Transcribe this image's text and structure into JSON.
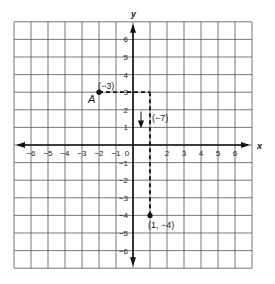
{
  "figure": {
    "type": "coordinate-grid",
    "grid": {
      "x_min": -7,
      "x_max": 7,
      "y_min": -7,
      "y_max": 7,
      "step": 1
    },
    "axes": {
      "x_label": "x",
      "y_label": "y",
      "x_ticks": [
        "-6",
        "-5",
        "-4",
        "-3",
        "-2",
        "-1",
        "0",
        "2",
        "3",
        "4",
        "5",
        "6"
      ],
      "y_ticks": [
        "6",
        "5",
        "4",
        "3",
        "2",
        "1",
        "-1",
        "-2",
        "-3",
        "-4",
        "-5",
        "-6"
      ]
    },
    "points": [
      {
        "name": "A",
        "x": -2,
        "y": 3,
        "label": "A"
      },
      {
        "name": "end",
        "x": 1,
        "y": -4,
        "label": "(1, −4)"
      }
    ],
    "path": [
      {
        "from": [
          -2,
          3
        ],
        "to": [
          1,
          3
        ],
        "style": "dashed",
        "annotation": "(−3)"
      },
      {
        "from": [
          1,
          3
        ],
        "to": [
          1,
          -4
        ],
        "style": "dashed",
        "annotation": "(−7)"
      }
    ],
    "arrow_annotation": {
      "direction": "down",
      "label": "(−7)"
    },
    "horizontal_annotation": {
      "label": "(−3)"
    },
    "colors": {
      "grid": "#555555",
      "axis": "#111111",
      "background": "#ffffff"
    }
  }
}
